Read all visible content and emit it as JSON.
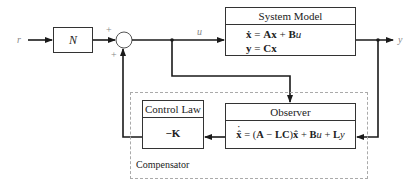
{
  "diagram": {
    "input_label": "r",
    "output_label": "y",
    "control_signal_label": "u",
    "gain_block": {
      "label": "N"
    },
    "summing_junction": {
      "plus_top": "+",
      "plus_bottom": "+"
    },
    "system_model": {
      "title": "System Model",
      "eq1": {
        "lhs": "ẋ",
        "eq": " = ",
        "a": "Ax",
        "plus": " + ",
        "b": "B",
        "u": "u"
      },
      "eq2": {
        "lhs": "y",
        "eq": " = ",
        "rhs": "Cx"
      }
    },
    "observer": {
      "title": "Observer",
      "equation": {
        "lhs": "x̂",
        "eq": " = (",
        "a": "A",
        "minus": " − ",
        "lc": "LC",
        "close": ")",
        "xhat": "x̂",
        "plus1": " + ",
        "b": "B",
        "u": "u",
        "plus2": " + ",
        "l": "L",
        "y": "y"
      }
    },
    "control_law": {
      "title": "Control Law",
      "gain": "−K"
    },
    "compensator": {
      "label": "Compensator"
    }
  },
  "colors": {
    "line": "#1a1a1a",
    "box_border": "#333333",
    "dashed": "#aaaaaa",
    "signal_label": "#888888"
  }
}
